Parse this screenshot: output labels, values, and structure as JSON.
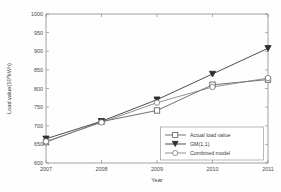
{
  "chart_data": {
    "type": "line",
    "title": "",
    "xlabel": "Year",
    "ylabel": "Load value(10⁸kWh)",
    "x": [
      2007,
      2008,
      2009,
      2010,
      2011
    ],
    "xticklabels": [
      "2007",
      "2008",
      "2009",
      "2010",
      "2011"
    ],
    "yticklabels": [
      "600",
      "650",
      "700",
      "750",
      "800",
      "850",
      "900",
      "950",
      "1000"
    ],
    "yticks": [
      600,
      650,
      700,
      750,
      800,
      850,
      900,
      950,
      1000
    ],
    "xlim": [
      2007,
      2011
    ],
    "ylim": [
      600,
      1000
    ],
    "grid": false,
    "legend_position": "lower right",
    "series": [
      {
        "name": "Actual load value",
        "marker": "square",
        "color": "#5a5a5a",
        "values": [
          656,
          711,
          741,
          810,
          824
        ]
      },
      {
        "name": "GM(1,1)",
        "marker": "triangle-down",
        "color": "#2e2e2e",
        "values": [
          665,
          712,
          770,
          839,
          908
        ]
      },
      {
        "name": "Combined model",
        "marker": "circle",
        "color": "#7d7d7d",
        "values": [
          658,
          709,
          762,
          804,
          828
        ]
      }
    ]
  },
  "axes": {
    "y_axis_title": "Load value(10⁸kWh)",
    "x_axis_title": "Year",
    "y_tick_0": "600",
    "y_tick_1": "650",
    "y_tick_2": "700",
    "y_tick_3": "750",
    "y_tick_4": "800",
    "y_tick_5": "850",
    "y_tick_6": "900",
    "y_tick_7": "950",
    "y_tick_8": "1000",
    "x_tick_0": "2007",
    "x_tick_1": "2008",
    "x_tick_2": "2009",
    "x_tick_3": "2010",
    "x_tick_4": "2011"
  },
  "legend": {
    "entry_0": "Actual load value",
    "entry_1": "GM(1,1)",
    "entry_2": "Combined model"
  }
}
